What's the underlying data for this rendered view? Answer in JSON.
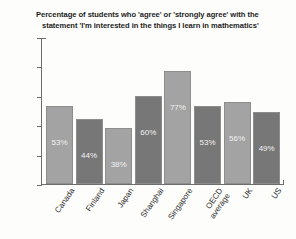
{
  "chart_data": {
    "type": "bar",
    "title": "Percentage of students who 'agree' or 'strongly agree' with the statement 'I'm interested in the things I learn in mathematics'",
    "title_lines": [
      "Percentage of students who 'agree' or 'strongly agree' with the",
      "statement 'I'm interested in the things I learn in mathematics'"
    ],
    "categories": [
      "Canada",
      "Finland",
      "Japan",
      "Shanghai",
      "Singapore",
      "OECD average",
      "UK",
      "US"
    ],
    "category_lines": [
      [
        "Canada"
      ],
      [
        "Finland"
      ],
      [
        "Japan"
      ],
      [
        "Shanghai"
      ],
      [
        "Singapore"
      ],
      [
        "OECD",
        "average"
      ],
      [
        "UK"
      ],
      [
        "US"
      ]
    ],
    "values": [
      53,
      44,
      38,
      60,
      77,
      53,
      56,
      49
    ],
    "data_labels": [
      "53%",
      "44%",
      "38%",
      "60%",
      "77%",
      "53%",
      "56%",
      "49%"
    ],
    "xlabel": "",
    "ylabel": "",
    "ylim": [
      0,
      100
    ],
    "yticks": [
      0,
      20,
      40,
      60,
      80,
      100
    ],
    "ytick_labels": [
      "0",
      "20",
      "40",
      "60",
      "80",
      "100"
    ],
    "grid": false,
    "legend": false,
    "bar_colors": [
      "#a3a3a3",
      "#777777",
      "#a3a3a3",
      "#777777",
      "#a3a3a3",
      "#777777",
      "#a3a3a3",
      "#777777"
    ],
    "bar_border_color": "#8d8d8d",
    "data_label_color": "#f2f2f2",
    "axis_color": "#6d6d6d",
    "background_color": "#fdfdfb"
  }
}
